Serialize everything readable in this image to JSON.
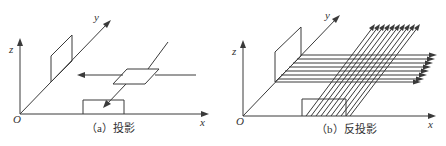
{
  "figure": {
    "panels": [
      {
        "id": "a",
        "caption": "（a）投影",
        "axes": {
          "x": "x",
          "y": "y",
          "z": "z",
          "origin": "O"
        },
        "description": "Projection: a planar region in space is projected along two directions onto the x-axis plane (rectangle) and the y-z plane (parallelogram)."
      },
      {
        "id": "b",
        "caption": "（b）反投影",
        "axes": {
          "x": "x",
          "y": "y",
          "z": "z",
          "origin": "O"
        },
        "description": "Back-projection: rays emanate from the projections (rectangle on x-axis, parallelogram on y-z plane) and are smeared back through space.",
        "horizontal_ray_count": 8,
        "diagonal_ray_count": 10
      }
    ]
  },
  "colors": {
    "line": "#3a3a3a",
    "background": "#ffffff"
  }
}
